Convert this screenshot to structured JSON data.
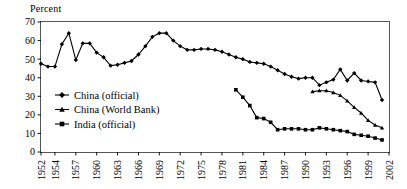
{
  "chart_data": {
    "type": "line",
    "title": "",
    "subtitle": "",
    "xlabel": "",
    "ylabel": "Percent",
    "ylim": [
      0,
      70
    ],
    "ytick_labels": [
      "0",
      "10",
      "20",
      "30",
      "40",
      "50",
      "60",
      "70"
    ],
    "ytick_values": [
      0,
      10,
      20,
      30,
      40,
      50,
      60,
      70
    ],
    "xlim": [
      1952,
      2002
    ],
    "xtick_labels": [
      "1952",
      "1954",
      "1957",
      "1960",
      "1963",
      "1966",
      "1969",
      "1972",
      "1975",
      "1978",
      "1981",
      "1984",
      "1987",
      "1990",
      "1993",
      "1996",
      "1999",
      "2002"
    ],
    "xtick_values": [
      1952,
      1954,
      1957,
      1960,
      1963,
      1966,
      1969,
      1972,
      1975,
      1978,
      1981,
      1984,
      1987,
      1990,
      1993,
      1996,
      1999,
      2002
    ],
    "grid": false,
    "legend_position": "center-left-inside",
    "series": [
      {
        "name": "China (official)",
        "marker": "diamond",
        "x": [
          1952,
          1953,
          1954,
          1955,
          1956,
          1957,
          1958,
          1959,
          1960,
          1961,
          1962,
          1963,
          1964,
          1965,
          1966,
          1967,
          1968,
          1969,
          1970,
          1971,
          1972,
          1973,
          1974,
          1975,
          1976,
          1977,
          1978,
          1979,
          1980,
          1981,
          1982,
          1983,
          1984,
          1985,
          1986,
          1987,
          1988,
          1989,
          1990,
          1991,
          1992,
          1993,
          1994,
          1995,
          1996,
          1997,
          1998,
          1999,
          2000,
          2001
        ],
        "values": [
          47.5,
          46.0,
          46.0,
          58.0,
          64.0,
          49.5,
          58.5,
          58.5,
          53.5,
          51.0,
          46.5,
          47.0,
          48.0,
          49.0,
          52.5,
          57.0,
          62.0,
          64.0,
          64.0,
          60.0,
          57.0,
          55.0,
          55.0,
          55.5,
          55.5,
          55.0,
          54.0,
          52.5,
          51.0,
          50.0,
          48.5,
          48.0,
          47.5,
          46.0,
          44.0,
          42.0,
          40.5,
          39.5,
          40.0,
          40.0,
          36.0,
          37.5,
          39.0,
          44.5,
          38.5,
          42.5,
          38.5,
          38.0,
          37.5,
          28.0
        ]
      },
      {
        "name": "China (World Bank)",
        "marker": "triangle",
        "x": [
          1991,
          1992,
          1993,
          1994,
          1995,
          1996,
          1997,
          1998,
          1999,
          2000,
          2001
        ],
        "values": [
          32.5,
          33.0,
          33.0,
          32.0,
          30.5,
          27.5,
          24.0,
          21.0,
          17.0,
          14.5,
          13.0
        ]
      },
      {
        "name": "India (official)",
        "marker": "square",
        "x": [
          1980,
          1981,
          1982,
          1983,
          1984,
          1985,
          1986,
          1987,
          1988,
          1989,
          1990,
          1991,
          1992,
          1993,
          1994,
          1995,
          1996,
          1997,
          1998,
          1999,
          2000,
          2001
        ],
        "values": [
          33.5,
          29.5,
          25.0,
          18.5,
          18.0,
          16.0,
          12.0,
          12.5,
          12.5,
          12.5,
          12.0,
          12.0,
          13.0,
          12.5,
          12.0,
          11.5,
          11.0,
          9.5,
          9.0,
          8.5,
          7.5,
          6.5
        ]
      }
    ]
  },
  "legend": {
    "entries": [
      {
        "label": "China (official)",
        "marker": "diamond"
      },
      {
        "label": "China (World Bank)",
        "marker": "triangle"
      },
      {
        "label": "India (official)",
        "marker": "square"
      }
    ]
  },
  "colors": {
    "series": "#000000",
    "frame": "#555555",
    "background": "#ffffff"
  }
}
